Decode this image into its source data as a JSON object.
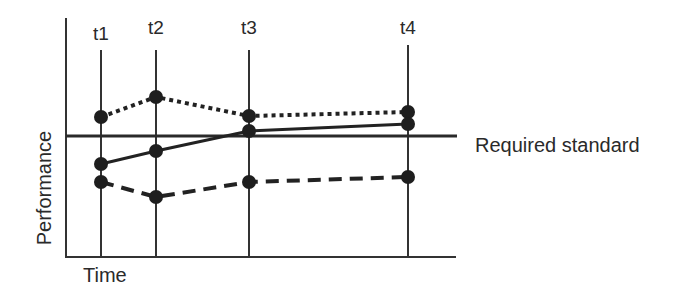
{
  "chart_data": {
    "type": "line",
    "title": "",
    "xlabel": "Time",
    "ylabel": "Performance",
    "categories": [
      "t1",
      "t2",
      "t3",
      "t4"
    ],
    "x_positions_px": [
      101,
      156,
      249,
      408
    ],
    "reference_line": {
      "label": "Required standard",
      "y_px": 136
    },
    "series": [
      {
        "name": "dotted",
        "style": "dotted",
        "y_px": [
          117,
          97,
          116,
          112
        ]
      },
      {
        "name": "solid",
        "style": "solid",
        "y_px": [
          164,
          151,
          131,
          124
        ]
      },
      {
        "name": "dashed",
        "style": "dashed",
        "y_px": [
          182,
          197,
          182,
          177
        ]
      }
    ],
    "grid": false,
    "legend": "none",
    "colors": {
      "line": "#222222",
      "marker": "#1e1e1e"
    }
  },
  "labels": {
    "t1": "t1",
    "t2": "t2",
    "t3": "t3",
    "t4": "t4",
    "xlabel": "Time",
    "ylabel": "Performance",
    "standard": "Required standard"
  }
}
